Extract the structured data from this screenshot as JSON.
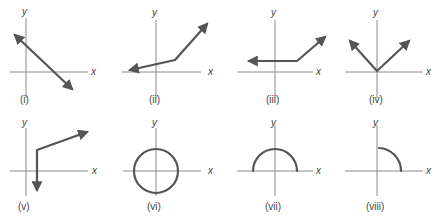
{
  "figure": {
    "axis_labels": {
      "x": "x",
      "y": "y"
    },
    "colors": {
      "axis": "#8a8a8a",
      "curve": "#555555",
      "text": "#444444"
    },
    "panels": [
      {
        "id": "i",
        "caption": "(i)",
        "description": "straight line with negative slope, arrows both ends"
      },
      {
        "id": "ii",
        "caption": "(ii)",
        "description": "piecewise linear: shallow line left with arrow, steeper line right with arrow"
      },
      {
        "id": "iii",
        "caption": "(iii)",
        "description": "piecewise: horizontal ray left with arrow, rising ray right with arrow"
      },
      {
        "id": "iv",
        "caption": "(iv)",
        "description": "V shape with vertex at origin, arrows both arms"
      },
      {
        "id": "v",
        "caption": "(v)",
        "description": "vertical ray down with arrow, then rising ray right with arrow"
      },
      {
        "id": "vi",
        "caption": "(vi)",
        "description": "full circle centered at origin"
      },
      {
        "id": "vii",
        "caption": "(vii)",
        "description": "upper semicircle centered at origin"
      },
      {
        "id": "viii",
        "caption": "(viii)",
        "description": "quarter circle arc in first quadrant"
      }
    ]
  }
}
